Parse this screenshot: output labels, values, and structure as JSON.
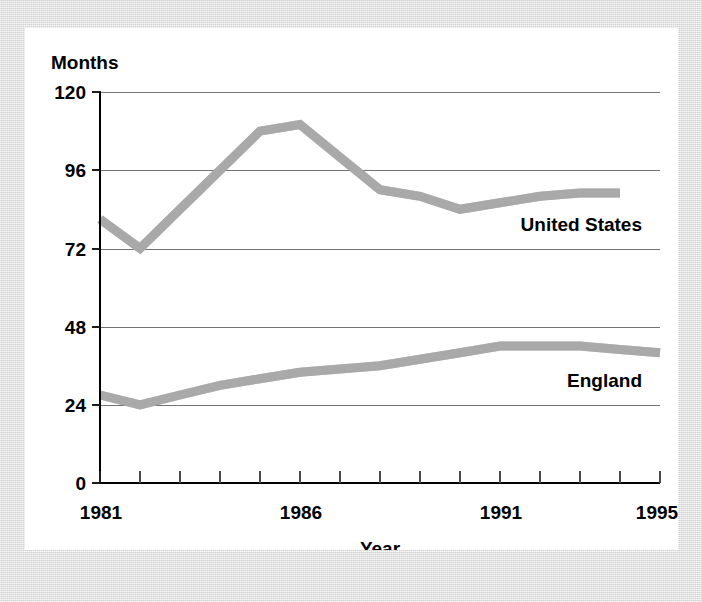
{
  "chart_data": {
    "type": "line",
    "title": "",
    "xlabel": "Year",
    "ylabel": "Months",
    "xlim": [
      1981,
      1995
    ],
    "ylim": [
      0,
      120
    ],
    "ytick_values": [
      0,
      24,
      48,
      72,
      96,
      120
    ],
    "ytick_labels": [
      "0",
      "24",
      "48",
      "72",
      "96",
      "120"
    ],
    "xtick_values": [
      1981,
      1982,
      1983,
      1984,
      1985,
      1986,
      1987,
      1988,
      1989,
      1990,
      1991,
      1992,
      1993,
      1994,
      1995
    ],
    "xtick_labeled": [
      1981,
      1986,
      1991,
      1995
    ],
    "xtick_labels": [
      "1981",
      "1986",
      "1991",
      "1995"
    ],
    "grid": "horizontal",
    "legend": "inline-labels",
    "series": [
      {
        "name": "United States",
        "color": "#9b9b9b",
        "x": [
          1981,
          1982,
          1983,
          1984,
          1985,
          1986,
          1987,
          1988,
          1989,
          1990,
          1991,
          1992,
          1993,
          1994
        ],
        "values": [
          81,
          72,
          84,
          96,
          108,
          110,
          100,
          90,
          88,
          84,
          86,
          88,
          89,
          89
        ]
      },
      {
        "name": "England",
        "color": "#9b9b9b",
        "x": [
          1981,
          1982,
          1983,
          1984,
          1985,
          1986,
          1987,
          1988,
          1989,
          1990,
          1991,
          1992,
          1993,
          1994,
          1995
        ],
        "values": [
          27,
          24,
          27,
          30,
          32,
          34,
          35,
          36,
          38,
          40,
          42,
          42,
          42,
          41,
          40
        ]
      }
    ],
    "annotations": [
      {
        "text": "United States",
        "x": 1992.6,
        "y": 74
      },
      {
        "text": "England",
        "x": 1993.6,
        "y": 30
      }
    ]
  },
  "colors": {
    "page_background": "#dddddd",
    "card_background": "#ffffff",
    "axis": "#000000",
    "gridline": "#737373",
    "series": "#9b9b9b",
    "text": "#000000"
  }
}
